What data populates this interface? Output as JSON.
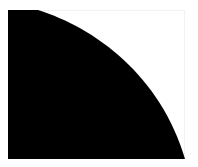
{
  "image": {
    "shape": "quarter-circle",
    "fill_color": "#000000",
    "background_color": "#ffffff",
    "border_color": "#f2f2f2"
  }
}
